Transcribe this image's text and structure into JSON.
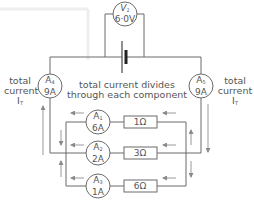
{
  "diagram": {
    "type": "parallel circuit",
    "voltmeter": {
      "symbol": "V",
      "sub": "1",
      "value": "6·0V"
    },
    "ammeters": [
      {
        "id": "A4",
        "symbol": "A",
        "sub": "4",
        "value": "9A"
      },
      {
        "id": "A5",
        "symbol": "A",
        "sub": "5",
        "value": "9A"
      },
      {
        "id": "A1",
        "symbol": "A",
        "sub": "1",
        "value": "6A"
      },
      {
        "id": "A2",
        "symbol": "A",
        "sub": "2",
        "value": "2A"
      },
      {
        "id": "A3",
        "symbol": "A",
        "sub": "3",
        "value": "1A"
      }
    ],
    "resistors": [
      {
        "label": "1Ω"
      },
      {
        "label": "3Ω"
      },
      {
        "label": "6Ω"
      }
    ],
    "annotations": {
      "left_line1": "total",
      "left_line2": "current",
      "left_line3": "I",
      "left_line3_sub": "T",
      "right_line1": "total",
      "right_line2": "current",
      "right_line3": "I",
      "right_line3_sub": "T",
      "center_line1": "total current divides",
      "center_line2": "through each component"
    },
    "colors": {
      "wire": "#6a6a6a",
      "arrow": "#9a9a9a",
      "text": "#555555"
    }
  }
}
